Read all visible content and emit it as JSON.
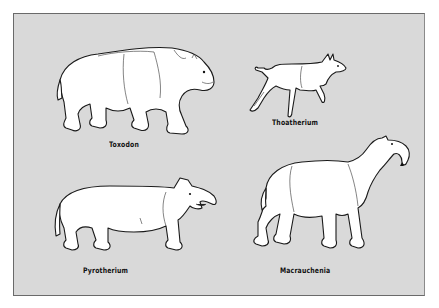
{
  "figure": {
    "background_color": "#d9d9d9",
    "border_color": "#6a6a6a",
    "animals": [
      {
        "name": "Toxodon",
        "position": "top-left"
      },
      {
        "name": "Thoatherium",
        "position": "top-right"
      },
      {
        "name": "Pyrotherium",
        "position": "bottom-left"
      },
      {
        "name": "Macrauchenia",
        "position": "bottom-right"
      }
    ]
  }
}
